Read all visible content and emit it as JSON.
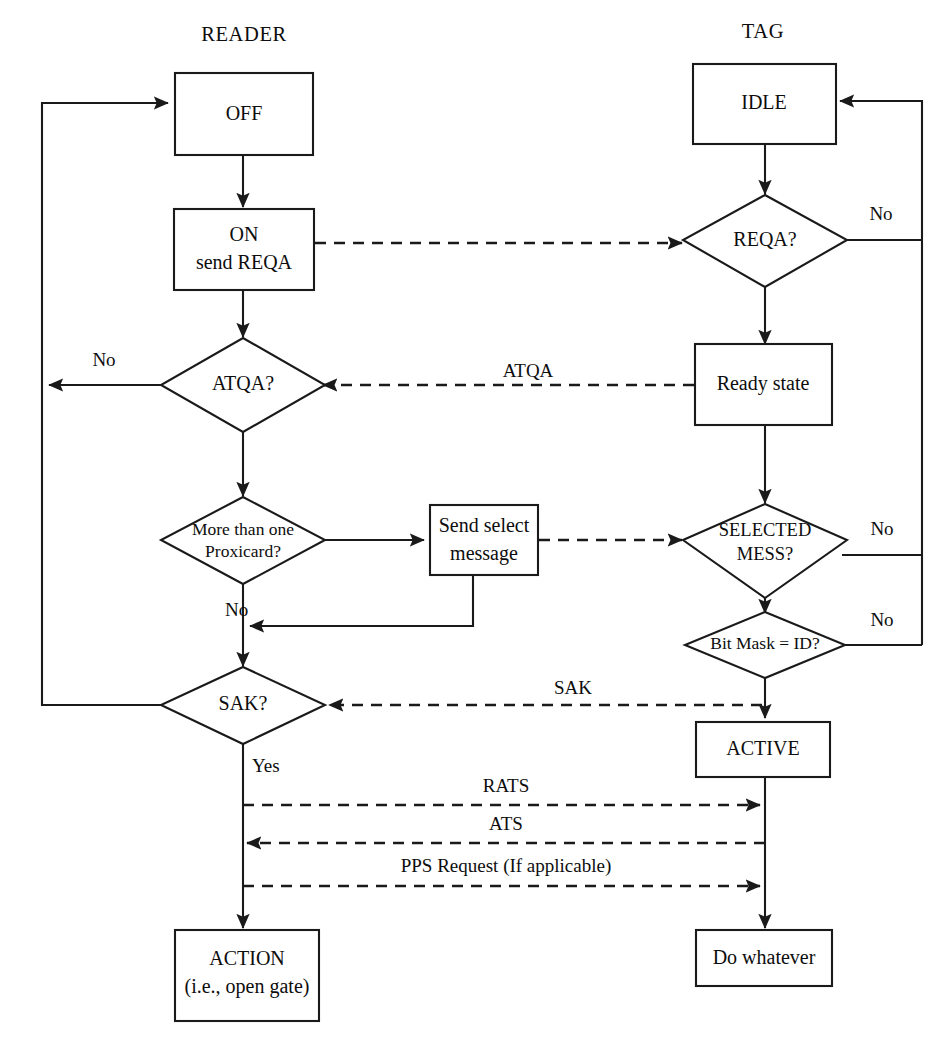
{
  "diagram": {
    "lanes": [
      {
        "id": "reader",
        "label": "READER"
      },
      {
        "id": "tag",
        "label": "TAG"
      }
    ],
    "colors": {
      "background": "#ffffff",
      "stroke": "#1a1a1a",
      "text": "#0d0d0d"
    },
    "nodes": {
      "off": {
        "label": "OFF",
        "shape": "rectangle"
      },
      "on_send_reqa": {
        "label_line1": "ON",
        "label_line2": "send REQA",
        "shape": "rectangle"
      },
      "atqa": {
        "label": "ATQA?",
        "shape": "diamond"
      },
      "more_than_one": {
        "label_line1": "More than one",
        "label_line2": "Proxicard?",
        "shape": "diamond"
      },
      "send_select": {
        "label_line1": "Send select",
        "label_line2": "message",
        "shape": "rectangle"
      },
      "sak": {
        "label": "SAK?",
        "shape": "diamond"
      },
      "action": {
        "label_line1": "ACTION",
        "label_line2": "(i.e., open gate)",
        "shape": "rectangle"
      },
      "idle": {
        "label": "IDLE",
        "shape": "rectangle"
      },
      "reqa": {
        "label": "REQA?",
        "shape": "diamond"
      },
      "ready_state": {
        "label": "Ready state",
        "shape": "rectangle"
      },
      "selected_mess": {
        "label_line1": "SELECTED",
        "label_line2": "MESS?",
        "shape": "diamond"
      },
      "bit_mask": {
        "label": "Bit Mask = ID?",
        "shape": "diamond"
      },
      "active": {
        "label": "ACTIVE",
        "shape": "rectangle"
      },
      "do_whatever": {
        "label": "Do whatever",
        "shape": "rectangle"
      }
    },
    "edge_labels": {
      "reqa_no": "No",
      "atqa_no": "No",
      "atqa_message": "ATQA",
      "selected_no": "No",
      "bitmask_no": "No",
      "proxicard_no": "No",
      "sak_message": "SAK",
      "sak_yes": "Yes",
      "rats": "RATS",
      "ats": "ATS",
      "pps": "PPS Request (If applicable)"
    }
  }
}
